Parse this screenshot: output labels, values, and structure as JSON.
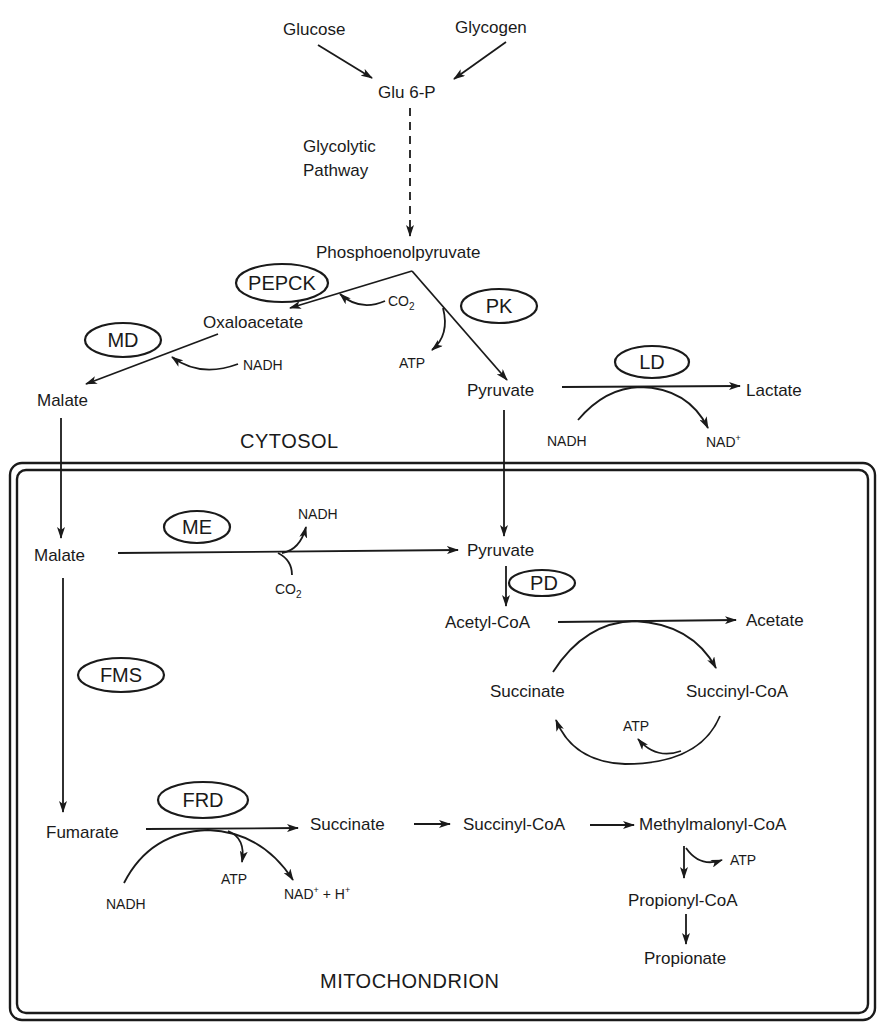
{
  "compartments": {
    "cytosol": "CYTOSOL",
    "mitochondrion": "MITOCHONDRION"
  },
  "metabolites": {
    "glucose": "Glucose",
    "glycogen": "Glycogen",
    "glu6p": "Glu 6-P",
    "glycolytic_line1": "Glycolytic",
    "glycolytic_line2": "Pathway",
    "pep": "Phosphoenolpyruvate",
    "oxaloacetate": "Oxaloacetate",
    "malate_cyto": "Malate",
    "pyruvate_cyto": "Pyruvate",
    "lactate": "Lactate",
    "malate_mito": "Malate",
    "pyruvate_mito": "Pyruvate",
    "acetyl_coa": "Acetyl-CoA",
    "acetate": "Acetate",
    "succinate_cycle": "Succinate",
    "succinyl_coa_cycle": "Succinyl-CoA",
    "fumarate": "Fumarate",
    "succinate": "Succinate",
    "succinyl_coa": "Succinyl-CoA",
    "methylmalonyl_coa": "Methylmalonyl-CoA",
    "propionyl_coa": "Propionyl-CoA",
    "propionate": "Propionate"
  },
  "cofactors": {
    "pepck_co2": "CO",
    "pepck_co2_sub": "2",
    "pk_atp": "ATP",
    "md_nadh": "NADH",
    "ld_nadh": "NADH",
    "ld_nad": "NAD",
    "ld_nad_sup": "+",
    "me_nadh": "NADH",
    "me_co2": "CO",
    "me_co2_sub": "2",
    "cycle_atp": "ATP",
    "frd_nadh": "NADH",
    "frd_atp": "ATP",
    "frd_nad": "NAD",
    "frd_nad_sup": "+",
    "frd_plus": " + H",
    "frd_h_sup": "+",
    "mmcoa_atp": "ATP"
  },
  "enzymes": {
    "pepck": "PEPCK",
    "pk": "PK",
    "md": "MD",
    "ld": "LD",
    "me": "ME",
    "pd": "PD",
    "fms": "FMS",
    "frd": "FRD"
  }
}
